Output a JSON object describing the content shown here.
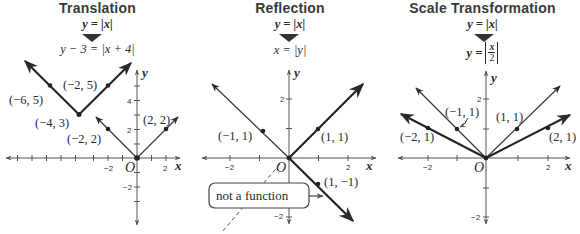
{
  "panels": [
    {
      "title": "Translation",
      "original_equation": "y = |x|",
      "transformed_equation": "y − 3 = |x + 4|",
      "axis_labels": {
        "x": "x",
        "y": "y",
        "origin": "O"
      },
      "x_ticks": [
        "−2",
        "2"
      ],
      "y_ticks": [
        "4",
        "2",
        "−2"
      ],
      "points": [
        {
          "label": "(−6, 5)"
        },
        {
          "label": "(−2, 5)"
        },
        {
          "label": "(−4, 3)"
        },
        {
          "label": "(−2, 2)"
        },
        {
          "label": "(2, 2)"
        }
      ]
    },
    {
      "title": "Reflection",
      "original_equation": "y = |x|",
      "transformed_equation": "x = |y|",
      "axis_labels": {
        "x": "x",
        "y": "y",
        "origin": "O"
      },
      "x_ticks": [
        "−2",
        "2"
      ],
      "y_ticks": [
        "2",
        "−2"
      ],
      "points": [
        {
          "label": "(−1, 1)"
        },
        {
          "label": "(1, 1)"
        },
        {
          "label": "(1, −1)"
        }
      ],
      "callout": "not a function"
    },
    {
      "title": "Scale Transformation",
      "original_equation": "y = |x|",
      "transformed_equation_lhs": "y = ",
      "transformed_equation_num": "x",
      "transformed_equation_den": "2",
      "axis_labels": {
        "x": "x",
        "y": "y",
        "origin": "O"
      },
      "x_ticks": [
        "−2",
        "2"
      ],
      "y_ticks": [
        "2",
        "−2"
      ],
      "points": [
        {
          "label": "(−1, 1)"
        },
        {
          "label": "(1, 1)"
        },
        {
          "label": "(−2, 1)"
        },
        {
          "label": "(2, 1)"
        }
      ]
    }
  ],
  "colors": {
    "ink": "#2a2a2a",
    "axis": "#555555",
    "original_graph": "#3a3a3a",
    "transformed_graph": "#222222"
  }
}
